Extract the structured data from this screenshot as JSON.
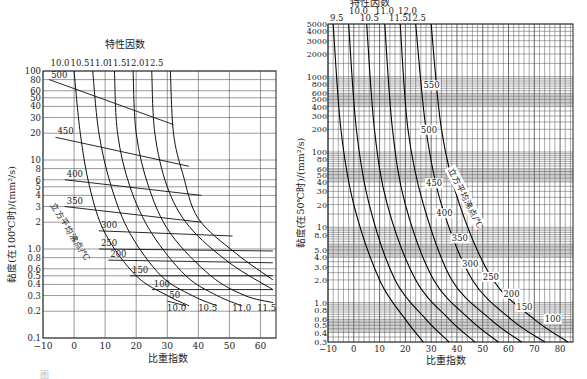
{
  "chart_data": [
    {
      "type": "line",
      "title": "特性因数",
      "xlabel": "比重指数",
      "ylabel": "黏度(在100℃时)/(mm²/s)",
      "y_scale": "log",
      "xlim": [
        -10,
        65
      ],
      "ylim": [
        0.1,
        100
      ],
      "x_ticks": [
        -10,
        0,
        10,
        20,
        30,
        40,
        50,
        60
      ],
      "y_ticks": [
        100,
        80,
        60,
        50,
        40,
        30,
        20,
        10,
        8,
        6,
        5,
        4,
        3,
        2,
        1.0,
        0.8,
        0.6,
        0.5,
        0.4,
        0.3,
        0.2,
        0.1
      ],
      "y_tick_labels": [
        "100",
        "80",
        "60",
        "50",
        "40",
        "30",
        "20",
        "10",
        "8",
        "6",
        "5",
        "4",
        "3",
        "2",
        "1.0",
        "0.8",
        "0.6",
        "0.5",
        "0.4",
        "0.3",
        "0.2",
        "0.1"
      ],
      "grid": true,
      "characterization_factor_labels_top": [
        "10.0",
        "10.5",
        "11.0",
        "11.5",
        "12.0",
        "12.5"
      ],
      "characterization_factor_labels_bottom": [
        "10.0",
        "10.5",
        "11.0",
        "11.5"
      ],
      "boiling_point_label": "立方平均沸点/℃",
      "series_boiling_point_lines": [
        {
          "name": "500",
          "points": [
            [
              -8,
              80
            ],
            [
              32,
              25
            ]
          ]
        },
        {
          "name": "450",
          "points": [
            [
              -6,
              18
            ],
            [
              37,
              8.5
            ]
          ]
        },
        {
          "name": "400",
          "points": [
            [
              -3,
              6
            ],
            [
              41,
              4
            ]
          ]
        },
        {
          "name": "350",
          "points": [
            [
              -3,
              3
            ],
            [
              41,
              2
            ]
          ]
        },
        {
          "name": "300",
          "points": [
            [
              8,
              1.6
            ],
            [
              51,
              1.4
            ]
          ]
        },
        {
          "name": "250",
          "points": [
            [
              8,
              1.0
            ],
            [
              64,
              0.95
            ]
          ]
        },
        {
          "name": "200",
          "points": [
            [
              11,
              0.75
            ],
            [
              64,
              0.7
            ]
          ]
        },
        {
          "name": "150",
          "points": [
            [
              18,
              0.5
            ],
            [
              64,
              0.5
            ]
          ]
        },
        {
          "name": "100",
          "points": [
            [
              25,
              0.35
            ],
            [
              64,
              0.35
            ]
          ]
        },
        {
          "name": "50",
          "points": [
            [
              30,
              0.26
            ],
            [
              36,
              0.23
            ]
          ]
        }
      ],
      "series_characterization_factor": [
        {
          "name": "10.0",
          "points": [
            [
              0,
              100
            ],
            [
              2,
              20
            ],
            [
              5,
              5
            ],
            [
              10,
              1.5
            ],
            [
              20,
              0.5
            ],
            [
              30,
              0.3
            ],
            [
              37,
              0.23
            ]
          ]
        },
        {
          "name": "10.5",
          "points": [
            [
              6,
              100
            ],
            [
              8,
              20
            ],
            [
              12,
              5
            ],
            [
              18,
              1.5
            ],
            [
              28,
              0.5
            ],
            [
              38,
              0.3
            ],
            [
              46,
              0.23
            ]
          ]
        },
        {
          "name": "11.0",
          "points": [
            [
              13,
              100
            ],
            [
              14,
              20
            ],
            [
              18,
              5
            ],
            [
              25,
              1.5
            ],
            [
              36,
              0.5
            ],
            [
              46,
              0.3
            ],
            [
              54,
              0.23
            ]
          ]
        },
        {
          "name": "11.5",
          "points": [
            [
              19,
              100
            ],
            [
              20,
              20
            ],
            [
              24,
              5
            ],
            [
              31,
              1.5
            ],
            [
              44,
              0.5
            ],
            [
              55,
              0.3
            ],
            [
              64,
              0.25
            ]
          ]
        },
        {
          "name": "12.0",
          "points": [
            [
              25,
              100
            ],
            [
              26,
              20
            ],
            [
              30,
              5
            ],
            [
              37,
              1.8
            ],
            [
              50,
              0.7
            ],
            [
              64,
              0.35
            ]
          ]
        },
        {
          "name": "12.5",
          "points": [
            [
              31,
              100
            ],
            [
              32,
              20
            ],
            [
              35,
              7
            ],
            [
              40,
              2.2
            ],
            [
              52,
              0.9
            ],
            [
              64,
              0.45
            ]
          ]
        }
      ]
    },
    {
      "type": "line",
      "title": "特性因数",
      "xlabel": "比重指数",
      "ylabel": "黏度(在50℃时)/(mm²/s)",
      "y_scale": "log",
      "xlim": [
        -10,
        85
      ],
      "ylim": [
        0.3,
        5000
      ],
      "x_ticks": [
        -10,
        0,
        10,
        20,
        30,
        40,
        50,
        60,
        70,
        80
      ],
      "y_ticks": [
        5000,
        4000,
        3000,
        2000,
        1000,
        800,
        600,
        500,
        400,
        300,
        200,
        100,
        80,
        60,
        50,
        40,
        30,
        20,
        10,
        8.0,
        5.0,
        4.0,
        3.0,
        2.0,
        1.0,
        0.8,
        0.6,
        0.5,
        0.4,
        0.3
      ],
      "y_tick_labels": [
        "5000",
        "4000",
        "3000",
        "2000",
        "1000",
        "800",
        "600",
        "500",
        "400",
        "300",
        "200",
        "100",
        "80",
        "60",
        "50",
        "40",
        "30",
        "20",
        "10",
        "8.0",
        "5.0",
        "4.0",
        "3.0",
        "2.0",
        "1.0",
        "0.8",
        "0.6",
        "0.5",
        "0.4",
        "0.3"
      ],
      "grid": "dense",
      "characterization_factor_labels_top": [
        "9.5",
        "10.0",
        "10.5",
        "11.0",
        "11.5",
        "12.0",
        "12.5"
      ],
      "boiling_point_label": "立方平均沸点/℃",
      "boiling_point_markers": [
        {
          "name": "550",
          "x": 27,
          "y": 700
        },
        {
          "name": "500",
          "x": 26,
          "y": 180
        },
        {
          "name": "450",
          "x": 28,
          "y": 35
        },
        {
          "name": "400",
          "x": 32,
          "y": 14
        },
        {
          "name": "350",
          "x": 38,
          "y": 6.5
        },
        {
          "name": "300",
          "x": 42,
          "y": 3.0
        },
        {
          "name": "250",
          "x": 50,
          "y": 2.0
        },
        {
          "name": "200",
          "x": 58,
          "y": 1.2
        },
        {
          "name": "150",
          "x": 63,
          "y": 0.8
        },
        {
          "name": "100",
          "x": 74,
          "y": 0.55
        }
      ],
      "series_characterization_factor": [
        {
          "name": "9.5",
          "points": [
            [
              -8,
              5000
            ],
            [
              -5,
              200
            ],
            [
              0,
              20
            ],
            [
              10,
              2
            ],
            [
              20,
              0.6
            ],
            [
              27,
              0.3
            ]
          ]
        },
        {
          "name": "10.0",
          "points": [
            [
              -2,
              5000
            ],
            [
              1,
              200
            ],
            [
              6,
              20
            ],
            [
              16,
              2
            ],
            [
              28,
              0.6
            ],
            [
              37,
              0.3
            ]
          ]
        },
        {
          "name": "10.5",
          "points": [
            [
              5,
              5000
            ],
            [
              8,
              200
            ],
            [
              13,
              20
            ],
            [
              24,
              2
            ],
            [
              37,
              0.6
            ],
            [
              47,
              0.3
            ]
          ]
        },
        {
          "name": "11.0",
          "points": [
            [
              12,
              5000
            ],
            [
              15,
              200
            ],
            [
              20,
              20
            ],
            [
              31,
              2
            ],
            [
              45,
              0.6
            ],
            [
              56,
              0.3
            ]
          ]
        },
        {
          "name": "11.5",
          "points": [
            [
              18,
              5000
            ],
            [
              21,
              200
            ],
            [
              27,
              20
            ],
            [
              38,
              2
            ],
            [
              53,
              0.6
            ],
            [
              65,
              0.3
            ]
          ]
        },
        {
          "name": "12.0",
          "points": [
            [
              24,
              5000
            ],
            [
              28,
              200
            ],
            [
              34,
              20
            ],
            [
              46,
              2
            ],
            [
              61,
              0.6
            ],
            [
              74,
              0.3
            ]
          ]
        },
        {
          "name": "12.5",
          "points": [
            [
              30,
              5000
            ],
            [
              34,
              200
            ],
            [
              41,
              20
            ],
            [
              54,
              2
            ],
            [
              70,
              0.6
            ],
            [
              83,
              0.3
            ]
          ]
        }
      ]
    }
  ],
  "left": {
    "title": "特性因数",
    "xlabel": "比重指数",
    "ylabel": "黏度(在100℃时)/(mm²/s)",
    "bp_label": "立方平均沸点/℃"
  },
  "right": {
    "title": "特性因数",
    "xlabel": "比重指数",
    "ylabel": "黏度(在50℃时)/(mm²/s)",
    "bp_label": "立方平均沸点/℃"
  },
  "caption": "图"
}
